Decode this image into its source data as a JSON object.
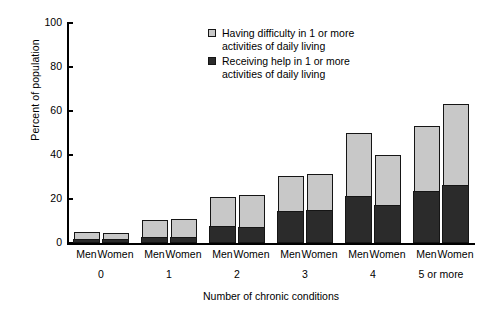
{
  "chart_data": {
    "type": "bar",
    "stacked": true,
    "title": "",
    "xlabel": "Number of chronic conditions",
    "ylabel": "Percent of population",
    "ylim": [
      0,
      100
    ],
    "yticks": [
      0,
      20,
      40,
      60,
      80,
      100
    ],
    "ytick_labels": [
      "0",
      "20",
      "40",
      "60",
      "80",
      "100"
    ],
    "grid": false,
    "legend_position": "top-center",
    "categories": [
      "0",
      "1",
      "2",
      "3",
      "4",
      "5 or more"
    ],
    "subcategories": [
      "Men",
      "Women"
    ],
    "series": [
      {
        "name": "Having difficulty in 1 or more activities of daily living",
        "color": "#c8c8c8",
        "note": "total height of stacked bar",
        "values": {
          "Men": [
            5,
            10.5,
            21,
            30.5,
            50,
            53
          ],
          "Women": [
            4.5,
            11,
            22,
            31.5,
            40,
            63
          ]
        }
      },
      {
        "name": "Receiving help in 1 or more activities of daily living",
        "color": "#2b2b2b",
        "note": "dark lower segment of each stacked bar",
        "values": {
          "Men": [
            2,
            3,
            8,
            14.5,
            21.5,
            23.5
          ],
          "Women": [
            2,
            3,
            7.5,
            15,
            17.5,
            26.5
          ]
        }
      }
    ]
  },
  "axes": {
    "y_title": "Percent of population",
    "x_title": "Number of chronic conditions",
    "y_ticks": [
      "0",
      "20",
      "40",
      "60",
      "80",
      "100"
    ],
    "group_labels": [
      "0",
      "1",
      "2",
      "3",
      "4",
      "5 or more"
    ],
    "series_labels": [
      "Men",
      "Women"
    ]
  },
  "legend": {
    "items": [
      {
        "swatch": "light",
        "label": "Having difficulty in 1 or more\nactivities of daily living"
      },
      {
        "swatch": "dark",
        "label": "Receiving help in 1 or more\nactivities of daily living"
      }
    ]
  },
  "colors": {
    "light_gray": "#c8c8c8",
    "dark": "#2b2b2b",
    "axis": "#000000",
    "background": "#ffffff"
  }
}
